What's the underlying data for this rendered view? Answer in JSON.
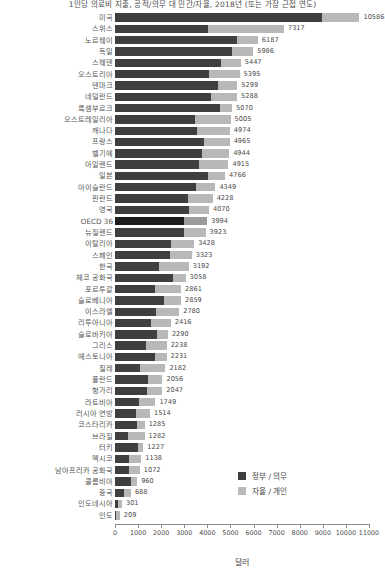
{
  "chart_data": {
    "type": "bar",
    "orientation": "horizontal",
    "stacked": true,
    "title": "1인당 의료비 지출, 공적/의무 대 민간/자율, 2018년 (또는 가장 근접 연도)",
    "xlabel": "달러",
    "ylabel": "",
    "xlim": [
      0,
      11000
    ],
    "xticks": [
      0,
      1000,
      2000,
      3000,
      4000,
      5000,
      6000,
      7000,
      8000,
      9000,
      10000,
      11000
    ],
    "xticklabels": [
      "0",
      "1000",
      "2000",
      "3000",
      "4000",
      "5000",
      "6000",
      "7000",
      "8000",
      "9000",
      "10000",
      "11000"
    ],
    "grid": false,
    "legend_position": "inside-lower-right",
    "highlight_category": "OECD 36",
    "colors": {
      "government": "#3f3f3f",
      "private": "#b8b8b8",
      "government_highlight": "#1d1d1d",
      "private_highlight": "#9b9b9b",
      "axis": "#8a8a8a",
      "text": "#4a4a4a"
    },
    "series": [
      {
        "name": "정부 / 의무",
        "key": "government"
      },
      {
        "name": "자율 / 개인",
        "key": "private"
      }
    ],
    "categories": [
      "미국",
      "스위스",
      "노르웨이",
      "독일",
      "스웨덴",
      "오스트리아",
      "덴마크",
      "네덜란드",
      "룩셈부르크",
      "오스트레일리아",
      "캐나다",
      "프랑스",
      "벨기에",
      "아일랜드",
      "일본",
      "아이슬란드",
      "핀란드",
      "영국",
      "OECD 36",
      "뉴질랜드",
      "이탈리아",
      "스페인",
      "한국",
      "체코 공화국",
      "포르투갈",
      "슬로베니아",
      "이스라엘",
      "리투아니아",
      "슬로바키아",
      "그리스",
      "에스토니아",
      "칠레",
      "폴란드",
      "헝가리",
      "라트비아",
      "러시아 연방",
      "코스타리카",
      "브라질",
      "터키",
      "멕시코",
      "남아프리카 공화국",
      "콜롬비아",
      "중국",
      "인도네시아",
      "인도"
    ],
    "totals": [
      10586,
      7317,
      6187,
      5986,
      5447,
      5395,
      5299,
      5288,
      5070,
      5005,
      4974,
      4965,
      4944,
      4915,
      4766,
      4349,
      4228,
      4070,
      3994,
      3923,
      3428,
      3323,
      3192,
      3058,
      2861,
      2859,
      2780,
      2416,
      2290,
      2238,
      2231,
      2182,
      2056,
      2047,
      1749,
      1514,
      1285,
      1282,
      1227,
      1138,
      1072,
      960,
      688,
      301,
      209
    ],
    "values": {
      "government": [
        8949,
        4018,
        5268,
        5070,
        4575,
        4066,
        4447,
        4165,
        4555,
        3457,
        3563,
        3869,
        3758,
        3648,
        4026,
        3500,
        3160,
        3189,
        2981,
        3003,
        2433,
        2400,
        1910,
        2528,
        1753,
        2111,
        1789,
        1564,
        1827,
        1343,
        1733,
        1064,
        1435,
        1406,
        1050,
        900,
        944,
        550,
        1010,
        585,
        620,
        700,
        390,
        150,
        57
      ],
      "private": [
        1637,
        3299,
        919,
        916,
        872,
        1329,
        852,
        1123,
        515,
        1548,
        1411,
        1096,
        1186,
        1267,
        740,
        849,
        1068,
        881,
        1013,
        920,
        995,
        923,
        1282,
        530,
        1108,
        748,
        991,
        852,
        463,
        895,
        498,
        1118,
        621,
        641,
        699,
        614,
        341,
        732,
        217,
        553,
        452,
        260,
        298,
        151,
        152
      ]
    }
  },
  "legend": {
    "items": [
      {
        "label": "정부 / 의무",
        "color": "#3f3f3f"
      },
      {
        "label": "자율 / 개인",
        "color": "#b8b8b8"
      }
    ]
  },
  "axis": {
    "x_title": "달러"
  }
}
